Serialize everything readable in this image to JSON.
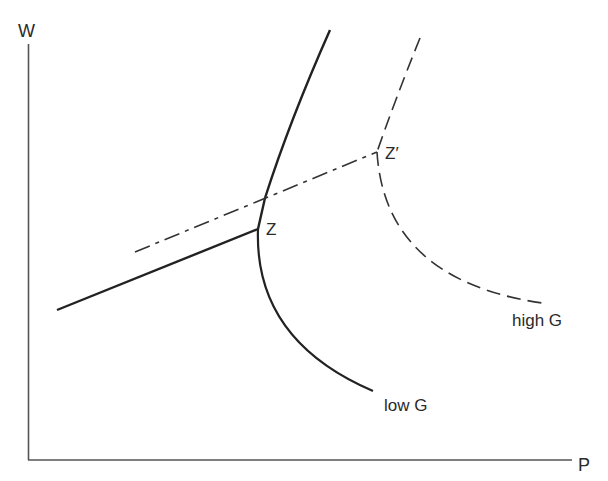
{
  "axes": {
    "y_label": "W",
    "x_label": "P"
  },
  "points": {
    "z": "Z",
    "z_prime": "Z′"
  },
  "curves": {
    "low_g": "low G",
    "high_g": "high G"
  },
  "colors": {
    "ink": "#2a2a2a",
    "background": "#ffffff"
  }
}
